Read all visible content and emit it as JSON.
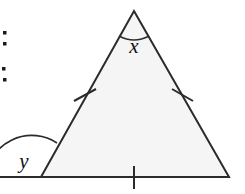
{
  "figure": {
    "name": "isosceles-triangle-with-exterior-angle",
    "background_color": "#ffffff",
    "fill_color": "#f5f5f5",
    "stroke_color": "#2b2b2b",
    "label_color": "#111111",
    "width": 245,
    "height": 194
  },
  "triangle": {
    "apex": {
      "x": 134,
      "y": 11
    },
    "bottom_left": {
      "x": 41,
      "y": 177
    },
    "bottom_right": {
      "x": 229,
      "y": 177
    }
  },
  "baseline_extension": {
    "from_x": 0,
    "to_x": 229,
    "y": 177
  },
  "tick_marks": [
    {
      "name": "left-side-tick",
      "x": 85,
      "y": 95
    },
    {
      "name": "right-side-tick",
      "x": 182,
      "y": 95
    },
    {
      "name": "base-tick",
      "x": 134,
      "y": 177
    }
  ],
  "angles": [
    {
      "id": "apex-angle",
      "label": "x",
      "label_x": 134,
      "label_y": 52,
      "arc": "M 119 36 Q 134 44 149 36",
      "type": "interior"
    },
    {
      "id": "exterior-angle",
      "label": "y",
      "label_x": 24,
      "label_y": 167,
      "arc": "M -12 177 A 44 44 0 0 1 58 144",
      "type": "exterior"
    }
  ],
  "left_margin_marks": [
    {
      "name": "colon-mark-upper",
      "x": 5,
      "y": 33
    },
    {
      "name": "colon-mark-upper-2",
      "x": 5,
      "y": 43
    },
    {
      "name": "colon-mark-lower",
      "x": 4,
      "y": 69
    },
    {
      "name": "colon-mark-lower-2",
      "x": 5,
      "y": 79
    }
  ]
}
